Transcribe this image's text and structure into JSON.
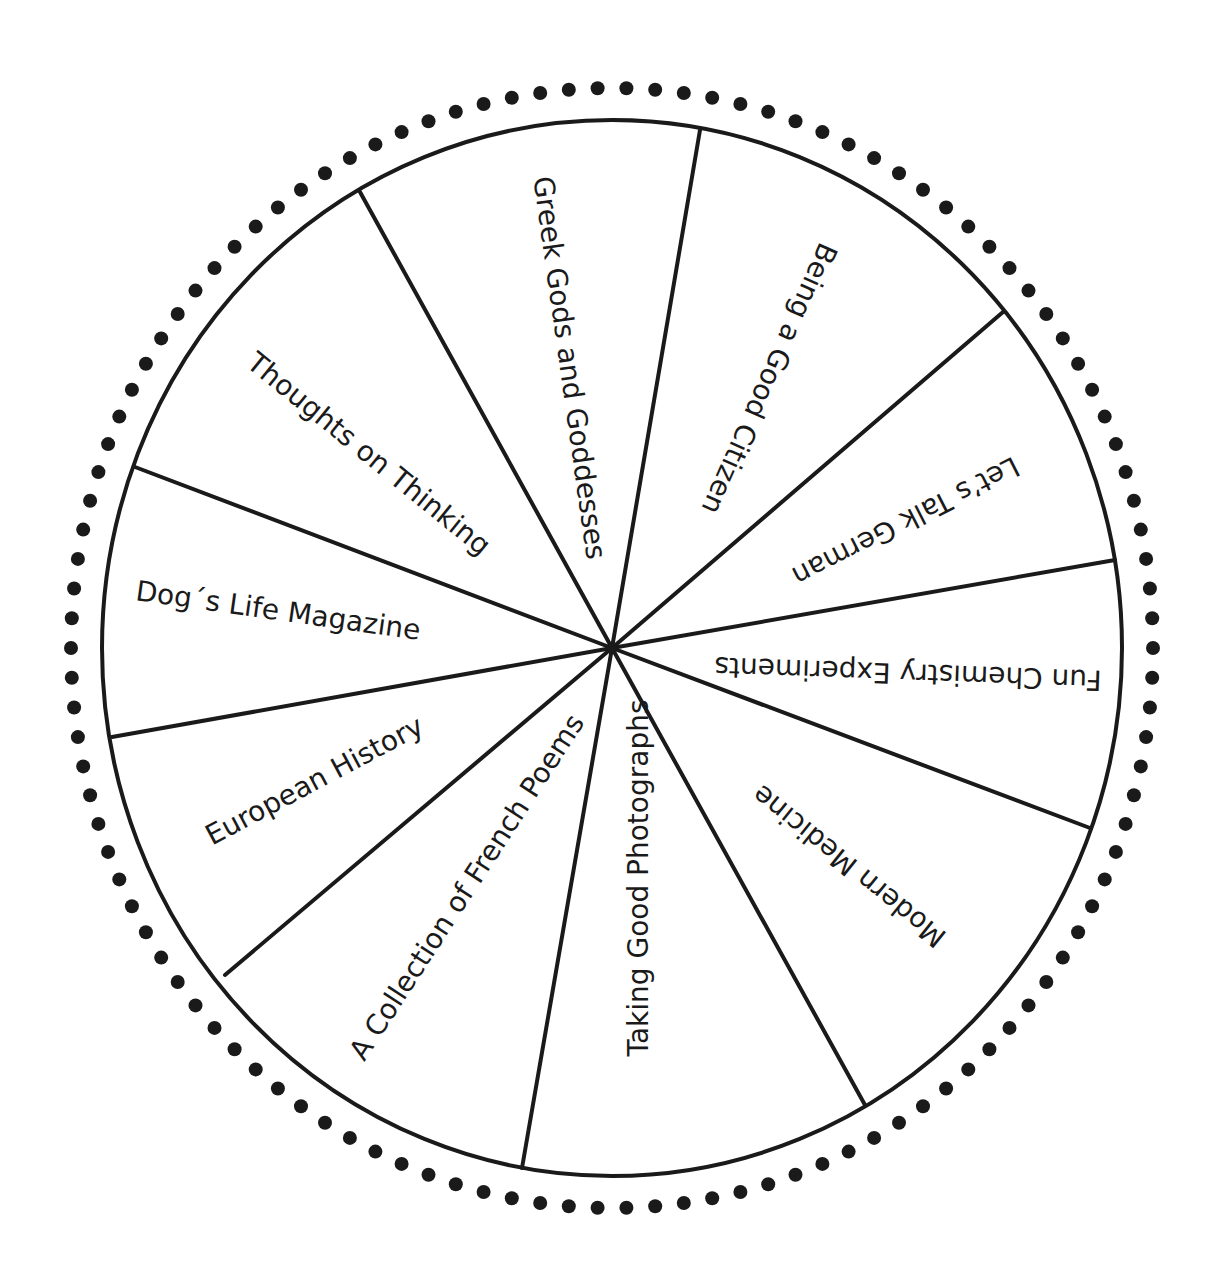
{
  "wheel": {
    "center": [
      612,
      648
    ],
    "radius_x": 510,
    "radius_y": 528,
    "dot_radius_x": 541,
    "dot_radius_y": 560,
    "dot_count": 118,
    "dot_size": 7,
    "line_color": "#1a1a1a",
    "dot_color": "#1a1a1a",
    "spoke_endpoints": [
      [
        700,
        130
      ],
      [
        1003,
        312
      ],
      [
        1115,
        560
      ],
      [
        1090,
        828
      ],
      [
        865,
        1105
      ],
      [
        522,
        1168
      ],
      [
        225,
        975
      ],
      [
        112,
        737
      ],
      [
        135,
        467
      ],
      [
        360,
        192
      ]
    ]
  },
  "segments": [
    {
      "label": "Greek Gods and Goddesses",
      "x": 568,
      "y": 368,
      "angle": 82
    },
    {
      "label": "Being a Good Citizen",
      "x": 768,
      "y": 378,
      "angle": 114
    },
    {
      "label": "Let’s Talk German",
      "x": 905,
      "y": 520,
      "angle": 153
    },
    {
      "label": "Fun Chemistry Experiments",
      "x": 908,
      "y": 672,
      "angle": 182
    },
    {
      "label": "Modern Medicine",
      "x": 850,
      "y": 865,
      "angle": 219
    },
    {
      "label": "Taking Good Photographs",
      "x": 640,
      "y": 878,
      "angle": -90
    },
    {
      "label": "A Collection of French Poems",
      "x": 468,
      "y": 888,
      "angle": -57
    },
    {
      "label": "European History",
      "x": 315,
      "y": 782,
      "angle": -28
    },
    {
      "label": "Dog´s Life Magazine",
      "x": 278,
      "y": 612,
      "angle": 8
    },
    {
      "label": "Thoughts on Thinking",
      "x": 368,
      "y": 455,
      "angle": 39
    }
  ]
}
